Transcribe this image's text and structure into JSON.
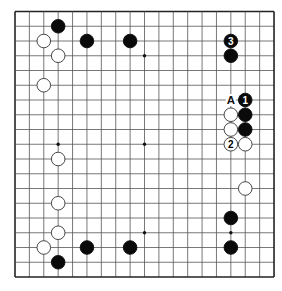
{
  "board": {
    "size": 19,
    "origin_x": 15,
    "origin_y": 11.5,
    "spacing_x": 14.39,
    "spacing_y": 14.75,
    "stone_radius": 6.8,
    "line_color": "#555555",
    "frame_color": "#222222",
    "black_color": "#0a0a0a",
    "white_color": "#ffffff",
    "star_points": [
      [
        3,
        3
      ],
      [
        9,
        3
      ],
      [
        15,
        3
      ],
      [
        3,
        9
      ],
      [
        9,
        9
      ],
      [
        15,
        9
      ],
      [
        3,
        15
      ],
      [
        9,
        15
      ],
      [
        15,
        15
      ]
    ]
  },
  "stones": [
    {
      "color": "black",
      "col": 3,
      "row": 1,
      "label": ""
    },
    {
      "color": "white",
      "col": 2,
      "row": 2,
      "label": ""
    },
    {
      "color": "white",
      "col": 3,
      "row": 3,
      "label": ""
    },
    {
      "color": "black",
      "col": 5,
      "row": 2,
      "label": ""
    },
    {
      "color": "black",
      "col": 8,
      "row": 2,
      "label": ""
    },
    {
      "color": "white",
      "col": 2,
      "row": 5,
      "label": ""
    },
    {
      "color": "black",
      "col": 15,
      "row": 2,
      "label": "3"
    },
    {
      "color": "black",
      "col": 15,
      "row": 3,
      "label": ""
    },
    {
      "color": "black",
      "col": 16,
      "row": 6,
      "label": "1"
    },
    {
      "color": "white",
      "col": 15,
      "row": 7,
      "label": ""
    },
    {
      "color": "black",
      "col": 16,
      "row": 7,
      "label": ""
    },
    {
      "color": "white",
      "col": 15,
      "row": 8,
      "label": ""
    },
    {
      "color": "black",
      "col": 16,
      "row": 8,
      "label": ""
    },
    {
      "color": "white",
      "col": 15,
      "row": 9,
      "label": "2"
    },
    {
      "color": "white",
      "col": 16,
      "row": 9,
      "label": ""
    },
    {
      "color": "white",
      "col": 3,
      "row": 10,
      "label": ""
    },
    {
      "color": "white",
      "col": 3,
      "row": 13,
      "label": ""
    },
    {
      "color": "white",
      "col": 3,
      "row": 15,
      "label": ""
    },
    {
      "color": "white",
      "col": 2,
      "row": 16,
      "label": ""
    },
    {
      "color": "black",
      "col": 3,
      "row": 17,
      "label": ""
    },
    {
      "color": "black",
      "col": 5,
      "row": 16,
      "label": ""
    },
    {
      "color": "black",
      "col": 8,
      "row": 16,
      "label": ""
    },
    {
      "color": "white",
      "col": 16,
      "row": 12,
      "label": ""
    },
    {
      "color": "black",
      "col": 15,
      "row": 14,
      "label": ""
    },
    {
      "color": "black",
      "col": 15,
      "row": 16,
      "label": ""
    }
  ],
  "markers": [
    {
      "col": 15,
      "row": 6,
      "text": "A"
    }
  ]
}
